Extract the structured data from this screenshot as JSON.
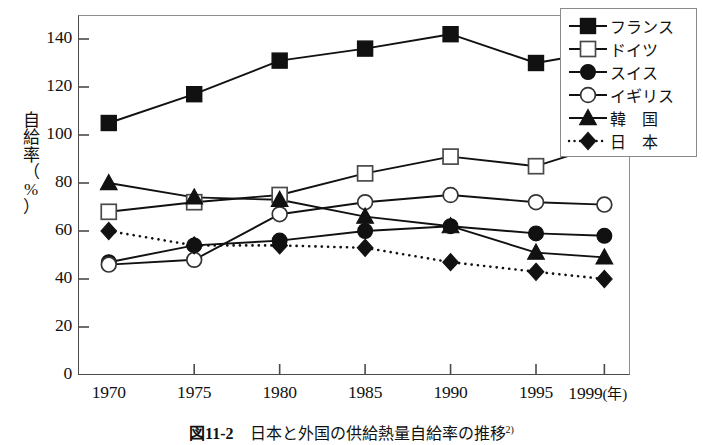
{
  "chart_data": {
    "type": "line",
    "caption_label": "図11-2",
    "caption_text": "日本と外国の供給熱量自給率の推移",
    "caption_superscript": "2)",
    "xlabel": "年",
    "ylabel": "自給率（%）",
    "ylabel_chars": [
      "自",
      "給",
      "率",
      "（",
      "%",
      "）"
    ],
    "categories": [
      "1970",
      "1975",
      "1980",
      "1985",
      "1990",
      "1995",
      "1999"
    ],
    "x": [
      1970,
      1975,
      1980,
      1985,
      1990,
      1995,
      1999
    ],
    "xtick_labels": [
      "1970",
      "1975",
      "1980",
      "1985",
      "1990",
      "1995",
      "1999"
    ],
    "xtick_unit": "(年)",
    "ytick_labels": [
      "0",
      "20",
      "40",
      "60",
      "80",
      "100",
      "120",
      "140"
    ],
    "ylim": [
      0,
      150
    ],
    "xlim": [
      1968.2,
      2000.5
    ],
    "grid": false,
    "legend_position": "top-right-outside",
    "series": [
      {
        "name": "フランス",
        "marker": "filled-square",
        "line": "solid",
        "values": [
          105,
          117,
          131,
          136,
          142,
          130,
          135
        ]
      },
      {
        "name": "ドイツ",
        "marker": "open-square",
        "line": "solid",
        "values": [
          68,
          72,
          75,
          84,
          91,
          87,
          96
        ]
      },
      {
        "name": "スイス",
        "marker": "filled-circle",
        "line": "solid",
        "values": [
          47,
          54,
          56,
          60,
          62,
          59,
          58
        ]
      },
      {
        "name": "イギリス",
        "marker": "open-circle",
        "line": "solid",
        "values": [
          46,
          48,
          67,
          72,
          75,
          72,
          71
        ]
      },
      {
        "name": "韓　国",
        "marker": "filled-triangle",
        "line": "solid",
        "values": [
          80,
          74,
          73,
          66,
          62,
          51,
          49
        ]
      },
      {
        "name": "日　本",
        "marker": "filled-diamond",
        "line": "dotted",
        "values": [
          60,
          54,
          54,
          53,
          47,
          43,
          40
        ]
      }
    ]
  },
  "legend": {
    "items": [
      {
        "label": "フランス",
        "marker": "filled-square",
        "line": "solid",
        "spaced": false
      },
      {
        "label": "ドイツ",
        "marker": "open-square",
        "line": "solid",
        "spaced": false
      },
      {
        "label": "スイス",
        "marker": "filled-circle",
        "line": "solid",
        "spaced": false
      },
      {
        "label": "イギリス",
        "marker": "open-circle",
        "line": "solid",
        "spaced": false
      },
      {
        "label": "韓　国",
        "marker": "filled-triangle",
        "line": "solid",
        "spaced": false
      },
      {
        "label": "日　本",
        "marker": "filled-diamond",
        "line": "dotted",
        "spaced": false
      }
    ]
  },
  "colors": {
    "ink": "#111111",
    "frame": "#4a4a4a",
    "frame_light": "#8d8d8d",
    "background": "#ffffff"
  }
}
